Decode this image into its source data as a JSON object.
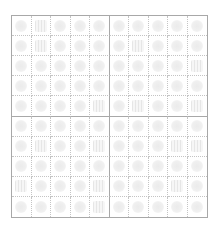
{
  "worksheet": {
    "rows": 10,
    "cols": 10,
    "colors": {
      "outer_border": "#a8a8a8",
      "inner_dotted": "#c4c4c4",
      "glyph": "#ebebeb"
    },
    "cells": [
      [
        "round",
        "striped",
        "round",
        "round",
        "round",
        "round",
        "round",
        "round",
        "round",
        "round"
      ],
      [
        "round",
        "striped",
        "round",
        "round",
        "round",
        "round",
        "striped",
        "round",
        "round",
        "round"
      ],
      [
        "round",
        "round",
        "round",
        "round",
        "round",
        "round",
        "round",
        "round",
        "round",
        "striped"
      ],
      [
        "round",
        "round",
        "round",
        "round",
        "round",
        "round",
        "round",
        "round",
        "round",
        "round"
      ],
      [
        "round",
        "round",
        "round",
        "round",
        "striped",
        "round",
        "striped",
        "round",
        "round",
        "striped"
      ],
      [
        "round",
        "round",
        "round",
        "round",
        "round",
        "round",
        "round",
        "round",
        "round",
        "round"
      ],
      [
        "round",
        "striped",
        "round",
        "round",
        "striped",
        "round",
        "round",
        "round",
        "striped",
        "striped"
      ],
      [
        "round",
        "round",
        "round",
        "round",
        "round",
        "round",
        "round",
        "round",
        "round",
        "round"
      ],
      [
        "striped",
        "round",
        "round",
        "round",
        "striped",
        "round",
        "round",
        "round",
        "striped",
        "round"
      ],
      [
        "round",
        "round",
        "round",
        "round",
        "striped",
        "round",
        "round",
        "round",
        "round",
        "round"
      ]
    ]
  }
}
